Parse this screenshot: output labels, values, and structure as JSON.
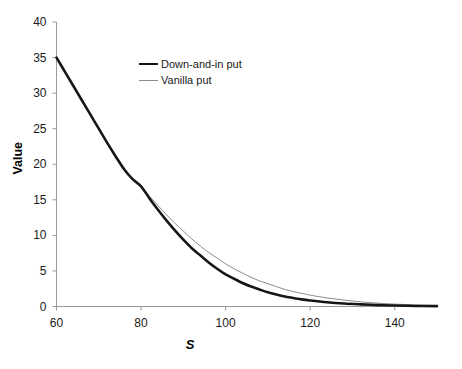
{
  "chart_data": {
    "type": "line",
    "title": "",
    "subtitle": "",
    "xlabel": "S",
    "ylabel": "Value",
    "xlim": [
      60,
      150
    ],
    "ylim": [
      0,
      40
    ],
    "xticks": [
      60,
      80,
      100,
      120,
      140
    ],
    "yticks": [
      0,
      5,
      10,
      15,
      20,
      25,
      30,
      35,
      40
    ],
    "grid": false,
    "legend_position": "upper-center",
    "annotations": [],
    "x": [
      60,
      62,
      64,
      66,
      68,
      70,
      72,
      74,
      76,
      78,
      80,
      82,
      84,
      86,
      88,
      90,
      92,
      94,
      96,
      98,
      100,
      102,
      104,
      106,
      108,
      110,
      112,
      114,
      116,
      118,
      120,
      124,
      128,
      132,
      136,
      140,
      145,
      150
    ],
    "series": [
      {
        "name": "Down-and-in put",
        "color": "#161616",
        "linewidth": 2.6,
        "values": [
          35.0,
          33.0,
          31.0,
          29.0,
          27.0,
          25.0,
          23.0,
          21.1,
          19.3,
          17.9,
          16.9,
          15.2,
          13.6,
          12.1,
          10.7,
          9.4,
          8.2,
          7.2,
          6.2,
          5.3,
          4.5,
          3.9,
          3.3,
          2.8,
          2.4,
          2.0,
          1.7,
          1.4,
          1.2,
          1.0,
          0.85,
          0.6,
          0.42,
          0.3,
          0.2,
          0.14,
          0.08,
          0.05
        ]
      },
      {
        "name": "Vanilla put",
        "color": "#8c8c8c",
        "linewidth": 1.0,
        "values": [
          35.0,
          33.0,
          31.0,
          29.0,
          27.0,
          25.0,
          23.0,
          21.1,
          19.3,
          17.9,
          16.9,
          15.5,
          14.2,
          12.9,
          11.7,
          10.6,
          9.5,
          8.5,
          7.6,
          6.8,
          6.0,
          5.3,
          4.7,
          4.1,
          3.6,
          3.2,
          2.8,
          2.4,
          2.1,
          1.85,
          1.6,
          1.2,
          0.9,
          0.65,
          0.47,
          0.34,
          0.22,
          0.14
        ]
      }
    ]
  },
  "legend": {
    "items": [
      {
        "label": "Down-and-in put",
        "style": "thick"
      },
      {
        "label": "Vanilla put",
        "style": "thin"
      }
    ]
  },
  "axes": {
    "y_title": "Value",
    "x_title": "S",
    "y_tick_labels": [
      "40",
      "35",
      "30",
      "25",
      "20",
      "15",
      "10",
      "5",
      "0"
    ],
    "x_tick_labels": [
      "60",
      "80",
      "100",
      "120",
      "140"
    ]
  },
  "colors": {
    "axis": "#9a9a9a",
    "text": "#1a1a1a",
    "series_primary": "#161616",
    "series_secondary": "#8c8c8c",
    "background": "#ffffff"
  }
}
